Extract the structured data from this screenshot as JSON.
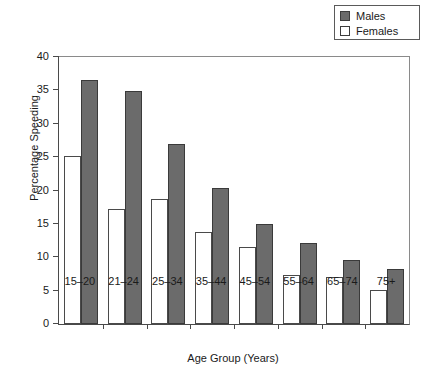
{
  "chart_data": {
    "type": "bar",
    "title": "",
    "xlabel": "Age Group (Years)",
    "ylabel": "Percentage Speeding",
    "categories": [
      "15–20",
      "21–24",
      "25–34",
      "35–44",
      "45–54",
      "55–64",
      "65–74",
      "75+"
    ],
    "series": [
      {
        "name": "Females",
        "values": [
          25.2,
          17.2,
          18.8,
          13.8,
          11.5,
          7.4,
          7.1,
          5.1
        ],
        "color": "#ffffff"
      },
      {
        "name": "Males",
        "values": [
          36.5,
          34.9,
          26.9,
          20.4,
          15.0,
          12.1,
          9.6,
          8.2
        ],
        "color": "#6b6b6b"
      }
    ],
    "ylim": [
      0,
      40
    ],
    "yticks": [
      "0",
      "5",
      "10",
      "15",
      "20",
      "25",
      "30",
      "35",
      "40"
    ],
    "ytick_values": [
      0,
      5,
      10,
      15,
      20,
      25,
      30,
      35,
      40
    ],
    "grid": false,
    "legend_position": "top-right",
    "legend": [
      {
        "label": "Males",
        "swatch": "filled-gray-square",
        "color": "#6b6b6b"
      },
      {
        "label": "Females",
        "swatch": "empty-white-square",
        "color": "#ffffff"
      }
    ]
  }
}
